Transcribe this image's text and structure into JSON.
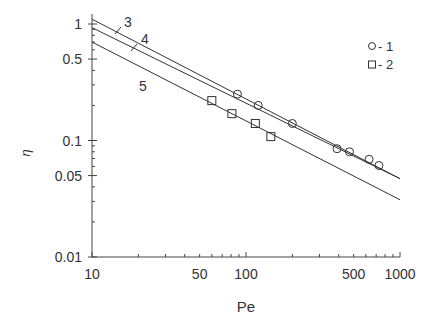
{
  "chart_data": {
    "type": "scatter",
    "title": "",
    "xlabel": "Pe",
    "ylabel": "η",
    "xscale": "log",
    "yscale": "log",
    "xlim": [
      10,
      1000
    ],
    "ylim": [
      0.01,
      1
    ],
    "x_ticks": [
      10,
      50,
      100,
      500,
      1000
    ],
    "x_tick_labels": [
      "10",
      "50",
      "100",
      "500",
      "1000"
    ],
    "y_ticks": [
      1,
      0.5,
      0.1,
      0.05,
      0.01
    ],
    "y_tick_labels": [
      "1",
      "0.5",
      "0.1",
      "0.05",
      "0.01"
    ],
    "grid": false,
    "legend_position": "upper right",
    "legend": [
      {
        "marker": "circle",
        "label": "- 1"
      },
      {
        "marker": "square",
        "label": "- 2"
      }
    ],
    "series": [
      {
        "name": "1",
        "marker": "circle",
        "x": [
          88,
          120,
          200,
          390,
          470,
          630,
          730
        ],
        "y": [
          0.25,
          0.2,
          0.14,
          0.085,
          0.08,
          0.069,
          0.061
        ]
      },
      {
        "name": "2",
        "marker": "square",
        "x": [
          60,
          81,
          115,
          145
        ],
        "y": [
          0.22,
          0.17,
          0.14,
          0.108
        ]
      }
    ],
    "lines": [
      {
        "name": "3",
        "label": "3",
        "x": [
          10,
          1000
        ],
        "y": [
          1.1,
          0.047
        ]
      },
      {
        "name": "4",
        "label": "4",
        "x": [
          10,
          1000
        ],
        "y": [
          0.93,
          0.047
        ]
      },
      {
        "name": "5",
        "label": "5",
        "x": [
          10,
          1000
        ],
        "y": [
          0.7,
          0.031
        ]
      }
    ]
  }
}
